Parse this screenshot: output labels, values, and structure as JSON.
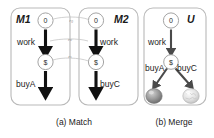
{
  "figure": {
    "background": "#ffffff",
    "panels": [
      {
        "id": "m1",
        "title": "M1",
        "nodes": [
          {
            "id": "m1-start",
            "label": "0"
          },
          {
            "id": "m1-money",
            "label": "$"
          }
        ],
        "edges": [
          {
            "id": "m1-work",
            "label": "work"
          },
          {
            "id": "m1-buya",
            "label": "buyA"
          }
        ]
      },
      {
        "id": "m2",
        "title": "M2",
        "nodes": [
          {
            "id": "m2-start",
            "label": "0"
          },
          {
            "id": "m2-money",
            "label": "$"
          }
        ],
        "edges": [
          {
            "id": "m2-work",
            "label": "work"
          },
          {
            "id": "m2-buyc",
            "label": "buyC"
          }
        ]
      },
      {
        "id": "u",
        "title": "U",
        "nodes": [
          {
            "id": "u-start",
            "label": "0"
          },
          {
            "id": "u-money",
            "label": "$"
          }
        ],
        "edges": [
          {
            "id": "u-work",
            "label": "work"
          },
          {
            "id": "u-buya",
            "label": "buyA"
          },
          {
            "id": "u-buyc",
            "label": "buyC"
          }
        ],
        "icons": [
          {
            "id": "u-ball-a",
            "name": "dark-sphere-icon",
            "color": "#8d8d8d"
          },
          {
            "id": "u-ball-c",
            "name": "light-sphere-icon",
            "color": "#d8d8d8"
          }
        ]
      }
    ],
    "relations": [
      {
        "id": "rel-0",
        "base": "r",
        "sub": "0"
      },
      {
        "id": "rel-w",
        "base": "r",
        "sub": "w"
      },
      {
        "id": "rel-s",
        "base": "r",
        "sub": "s"
      }
    ],
    "captions": [
      {
        "id": "caption-a",
        "label": "(a) Match"
      },
      {
        "id": "caption-b",
        "label": "(b) Merge"
      }
    ]
  }
}
